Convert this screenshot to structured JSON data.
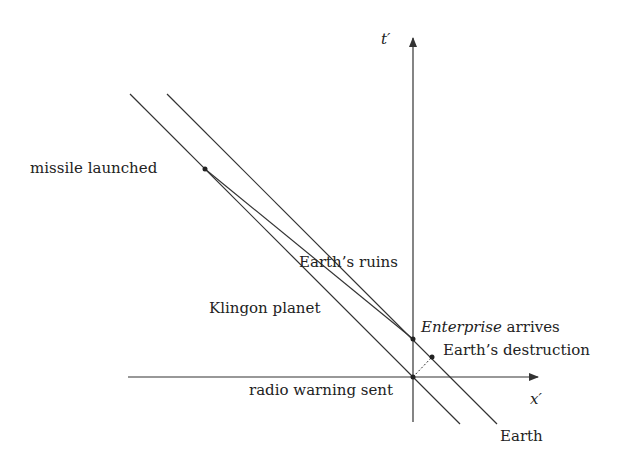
{
  "diagram": {
    "axes": {
      "time_label": "t′",
      "space_label": "x′"
    },
    "worldlines": {
      "klingon": "Klingon planet",
      "earth": "Earth"
    },
    "events": {
      "missile_launched": "missile launched",
      "earths_ruins": "Earth’s ruins",
      "enterprise_arrives_italic": "Enterprise",
      "enterprise_arrives_rest": " arrives",
      "earths_destruction": "Earth’s destruction",
      "radio_warning_sent": "radio warning sent"
    },
    "colors": {
      "line": "#333333",
      "text": "#222222",
      "background": "#ffffff"
    }
  }
}
